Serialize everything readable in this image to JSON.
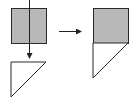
{
  "diagram": {
    "colors": {
      "background": "#ffffff",
      "square_fill": "#b8b8b8",
      "triangle_fill": "#ffffff",
      "stroke": "#2a2a2a",
      "arrow": "#222222"
    },
    "left_square": {
      "x": 11,
      "y": 8,
      "size": 35
    },
    "left_triangle": {
      "points": "11,62 46,62 11,97"
    },
    "down_arrow": {
      "x": 29,
      "y1": 47,
      "y2": 58
    },
    "right_arrow": {
      "y": 31,
      "x1": 59,
      "x2": 81
    },
    "composite": {
      "square": {
        "x": 93,
        "y": 8,
        "size": 35
      },
      "triangle": {
        "points": "93,43 128,43 93,78"
      }
    }
  }
}
